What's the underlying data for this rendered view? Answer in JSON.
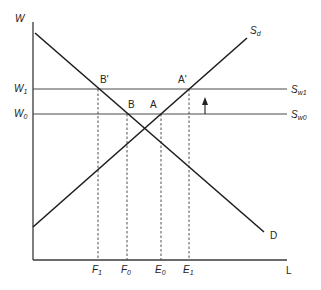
{
  "diagram": {
    "type": "labor-market supply-demand diagram",
    "axes": {
      "y_label": "W",
      "x_label": "L"
    },
    "curves": {
      "demand": {
        "label": "D"
      },
      "domestic_supply": {
        "label": "S",
        "subscript": "d"
      },
      "foreign_supply_1": {
        "label": "S",
        "subscript": "w1"
      },
      "foreign_supply_0": {
        "label": "S",
        "subscript": "w0"
      }
    },
    "wage_levels": [
      {
        "label": "W",
        "subscript": "1"
      },
      {
        "label": "W",
        "subscript": "0"
      }
    ],
    "points": {
      "B_prime": "B'",
      "A_prime": "A'",
      "B": "B",
      "A": "A"
    },
    "x_ticks": [
      {
        "label": "F",
        "subscript": "1"
      },
      {
        "label": "F",
        "subscript": "0"
      },
      {
        "label": "E",
        "subscript": "0"
      },
      {
        "label": "E",
        "subscript": "1"
      }
    ],
    "shift_arrow": {
      "direction": "up",
      "from": "S_w0",
      "to": "S_w1"
    }
  }
}
